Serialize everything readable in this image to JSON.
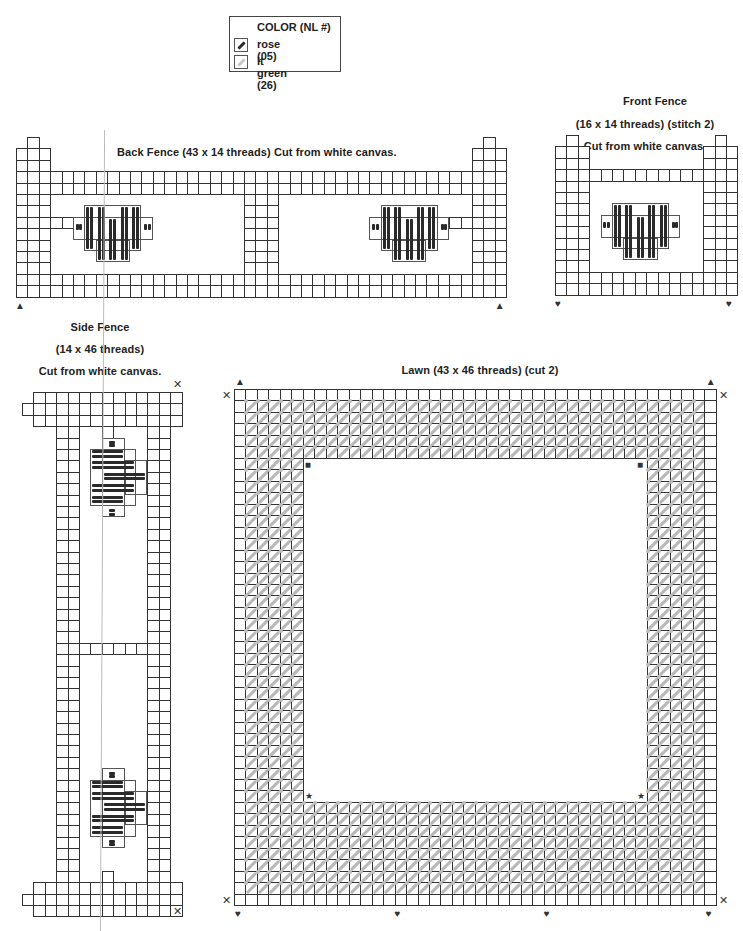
{
  "legend": {
    "title": "COLOR (NL #)",
    "items": [
      {
        "label": "rose (05)",
        "color": "#2a2a2a",
        "icon": "rose-stitch-icon"
      },
      {
        "label": "lt green (26)",
        "color": "#c4c4c4",
        "icon": "green-stitch-icon"
      }
    ]
  },
  "back_fence": {
    "title": "Back Fence (43 x 14 threads) Cut from white canvas.",
    "markers": [
      "triangle",
      "triangle"
    ]
  },
  "front_fence": {
    "title_line1": "Front Fence",
    "title_line2": "(16 x 14 threads) (stitch 2)",
    "title_line3": "Cut from white canvas.",
    "markers": [
      "heart",
      "heart"
    ]
  },
  "side_fence": {
    "title_line1": "Side Fence",
    "title_line2": "(14 x 46 threads)",
    "title_line3": "Cut from white canvas.",
    "markers": [
      "x",
      "x"
    ]
  },
  "lawn": {
    "title": "Lawn (43 x 46 threads) (cut 2)",
    "markers": {
      "top": [
        "triangle",
        "triangle"
      ],
      "corners": [
        "x",
        "x",
        "x",
        "x"
      ],
      "bottom": [
        "heart",
        "heart",
        "heart",
        "heart"
      ],
      "inner_top": [
        "square",
        "square"
      ],
      "inner_bottom": [
        "star",
        "star"
      ]
    }
  },
  "glyphs": {
    "triangle": "▲",
    "heart": "♥",
    "x": "✕",
    "square": "■",
    "star": "★"
  }
}
